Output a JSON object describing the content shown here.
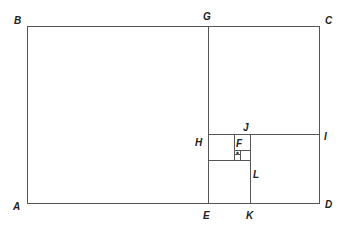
{
  "diagram": {
    "type": "golden-rectangle-spiral-subdivision",
    "stroke_color": "#555555",
    "label_color": "#222222",
    "points": {
      "A": {
        "label": "A"
      },
      "B": {
        "label": "B"
      },
      "C": {
        "label": "C"
      },
      "D": {
        "label": "D"
      },
      "E": {
        "label": "E"
      },
      "F": {
        "label": "F"
      },
      "G": {
        "label": "G"
      },
      "H": {
        "label": "H"
      },
      "I": {
        "label": "I"
      },
      "J": {
        "label": "J"
      },
      "K": {
        "label": "K"
      },
      "L": {
        "label": "L"
      }
    }
  }
}
